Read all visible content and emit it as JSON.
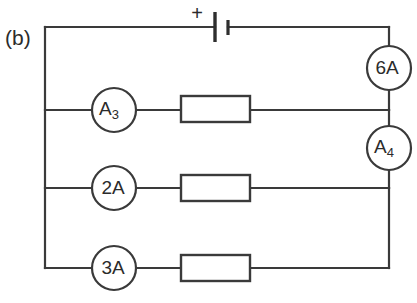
{
  "figure": {
    "panel_label": "(b)",
    "background_color": "#ffffff",
    "line_color": "#3a3a3a",
    "width": 417,
    "height": 303
  },
  "battery": {
    "polarity_label": "+",
    "terminal_long_x": 215,
    "terminal_short_x": 228,
    "rail_y": 27
  },
  "meters": {
    "series_top": {
      "label": "6A",
      "value": "6",
      "unit": "A",
      "cx": 389,
      "cy": 68,
      "r": 22
    },
    "series_mid": {
      "label": "A",
      "subscript": "4",
      "cx": 389,
      "cy": 148,
      "r": 22
    },
    "branch_1": {
      "label": "A",
      "subscript": "3",
      "cx": 114,
      "cy": 110,
      "r": 22
    },
    "branch_2": {
      "label": "2A",
      "value": "2",
      "unit": "A",
      "cx": 114,
      "cy": 188,
      "r": 22
    },
    "branch_3": {
      "label": "3A",
      "value": "3",
      "unit": "A",
      "cx": 114,
      "cy": 268,
      "r": 22
    }
  },
  "resistors": [
    {
      "name": "resistor-branch-1",
      "x": 181,
      "y": 96,
      "w": 69,
      "h": 26
    },
    {
      "name": "resistor-branch-2",
      "x": 181,
      "y": 175,
      "w": 69,
      "h": 26
    },
    {
      "name": "resistor-branch-3",
      "x": 181,
      "y": 255,
      "w": 69,
      "h": 26
    }
  ],
  "rails": {
    "left_x": 45,
    "right_x": 389,
    "top_y": 27,
    "branch_1_y": 110,
    "branch_2_y": 188,
    "branch_3_y": 268
  }
}
